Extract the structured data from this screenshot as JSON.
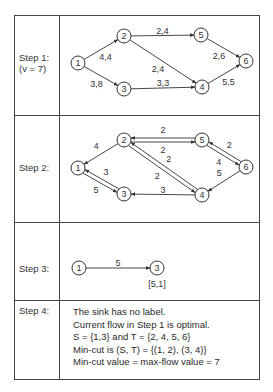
{
  "steps": [
    {
      "label": "Step 1:",
      "sublabel": "(v = 7)",
      "nodes": [
        {
          "id": "1",
          "x": 78,
          "y": 63
        },
        {
          "id": "2",
          "x": 124,
          "y": 36
        },
        {
          "id": "3",
          "x": 124,
          "y": 89
        },
        {
          "id": "4",
          "x": 202,
          "y": 87
        },
        {
          "id": "5",
          "x": 201,
          "y": 35
        },
        {
          "id": "6",
          "x": 246,
          "y": 61
        }
      ],
      "edges": [
        {
          "from": "1",
          "to": "2",
          "label": "4,4"
        },
        {
          "from": "1",
          "to": "3",
          "label": "3,8"
        },
        {
          "from": "2",
          "to": "5",
          "label": "2,4"
        },
        {
          "from": "2",
          "to": "4",
          "label": "2,4"
        },
        {
          "from": "3",
          "to": "4",
          "label": "3,3"
        },
        {
          "from": "5",
          "to": "6",
          "label": "2,6"
        },
        {
          "from": "4",
          "to": "6",
          "label": "5,5"
        }
      ]
    },
    {
      "label": "Step 2:",
      "nodes": [
        {
          "id": "1",
          "x": 78,
          "y": 168
        },
        {
          "id": "2",
          "x": 124,
          "y": 140
        },
        {
          "id": "3",
          "x": 124,
          "y": 194
        },
        {
          "id": "4",
          "x": 202,
          "y": 195
        },
        {
          "id": "5",
          "x": 202,
          "y": 140
        },
        {
          "id": "6",
          "x": 246,
          "y": 167
        }
      ],
      "edges": [
        {
          "from": "2",
          "to": "1",
          "label": "4"
        },
        {
          "from": "1",
          "to": "3",
          "label": "5"
        },
        {
          "from": "3",
          "to": "1",
          "label": "3"
        },
        {
          "from": "2",
          "to": "5",
          "label": "2"
        },
        {
          "from": "5",
          "to": "2",
          "label": "2"
        },
        {
          "from": "2",
          "to": "4",
          "label": "2"
        },
        {
          "from": "4",
          "to": "2",
          "label": "2"
        },
        {
          "from": "5",
          "to": "6",
          "label": "4"
        },
        {
          "from": "6",
          "to": "5",
          "label": "2"
        },
        {
          "from": "6",
          "to": "4",
          "label": "5"
        },
        {
          "from": "4",
          "to": "3",
          "label": "3"
        }
      ]
    },
    {
      "label": "Step 3:",
      "nodes": [
        {
          "id": "1",
          "x": 79,
          "y": 268
        },
        {
          "id": "3",
          "x": 157,
          "y": 268
        }
      ],
      "edges": [
        {
          "from": "1",
          "to": "3",
          "label": "5"
        }
      ],
      "node_label": "[5,1]"
    },
    {
      "label": "Step 4:",
      "lines": [
        "The sink has no label.",
        "Current flow in Step 1 is optimal.",
        "S = {1,3} and T = {2, 4, 5, 6}",
        "Min-cut is (S, T) = {(1, 2), (3, 4)}",
        "Min-cut value = max-flow value = 7"
      ]
    }
  ]
}
